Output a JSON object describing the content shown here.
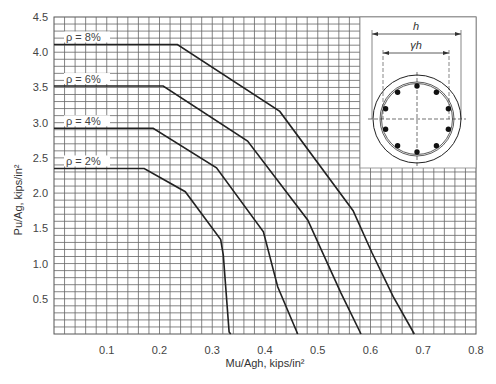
{
  "chart_data": {
    "type": "line",
    "title": "",
    "xlabel": "Mu/Agh, kips/in²",
    "ylabel": "Pu/Ag, kips/in²",
    "xlim": [
      0,
      0.8
    ],
    "ylim": [
      0,
      4.5
    ],
    "x_ticks": [
      "0.1",
      "0.2",
      "0.3",
      "0.4",
      "0.5",
      "0.6",
      "0.7",
      "0.8"
    ],
    "y_ticks": [
      "0.5",
      "1.0",
      "1.5",
      "2.0",
      "2.5",
      "3.0",
      "3.5",
      "4.0",
      "4.5"
    ],
    "grid": true,
    "grid_minor_x": 0.02,
    "grid_minor_y": 0.1,
    "series": [
      {
        "name": "ρ = 8%",
        "points": [
          [
            0,
            4.11
          ],
          [
            0.234,
            4.11
          ],
          [
            0.428,
            3.16
          ],
          [
            0.567,
            1.75
          ],
          [
            0.603,
            1.15
          ],
          [
            0.643,
            0.53
          ],
          [
            0.683,
            0
          ]
        ]
      },
      {
        "name": "ρ = 6%",
        "points": [
          [
            0,
            3.52
          ],
          [
            0.207,
            3.52
          ],
          [
            0.367,
            2.74
          ],
          [
            0.481,
            1.62
          ],
          [
            0.544,
            0.58
          ],
          [
            0.582,
            0
          ]
        ]
      },
      {
        "name": "ρ = 4%",
        "points": [
          [
            0,
            2.92
          ],
          [
            0.188,
            2.92
          ],
          [
            0.308,
            2.36
          ],
          [
            0.397,
            1.45
          ],
          [
            0.424,
            0.67
          ],
          [
            0.462,
            0
          ]
        ]
      },
      {
        "name": "ρ = 2%",
        "points": [
          [
            0,
            2.35
          ],
          [
            0.171,
            2.35
          ],
          [
            0.249,
            2.02
          ],
          [
            0.316,
            1.34
          ],
          [
            0.321,
            1.12
          ],
          [
            0.332,
            0.03
          ],
          [
            0.335,
            0
          ]
        ]
      }
    ],
    "inset": {
      "description": "circular column cross-section with 10 longitudinal bars and spiral",
      "dim_outer": "h",
      "dim_inner": "γh"
    }
  }
}
